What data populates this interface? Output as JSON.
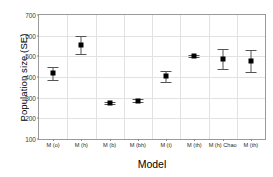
{
  "chart_data": {
    "type": "scatter",
    "title": "",
    "xlabel": "Model",
    "ylabel": "Population size (SE)",
    "categories": [
      "M (o)",
      "M (h)",
      "M (b)",
      "M (bh)",
      "M (t)",
      "M (th)",
      "M (h) Chao",
      "M (th)"
    ],
    "values": [
      421,
      553,
      274,
      285,
      404,
      503,
      487,
      478
    ],
    "error_low": [
      386,
      511,
      267,
      277,
      378,
      499,
      437,
      424
    ],
    "error_high": [
      447,
      598,
      281,
      293,
      430,
      507,
      536,
      529
    ],
    "ylim": [
      100,
      700
    ],
    "yticks": [
      100,
      200,
      300,
      400,
      500,
      600,
      700
    ],
    "ytick_labels": [
      "100",
      "200",
      "300",
      "400",
      "500",
      "600",
      "700"
    ],
    "grid": true,
    "legend": "none",
    "marker": "filled-square",
    "marker_color": "#000000",
    "errorbar_color": "#555555",
    "gridline_color": "#e2e2e2",
    "frame_color": "#9a9a9a",
    "background_color": "#ffffff"
  }
}
